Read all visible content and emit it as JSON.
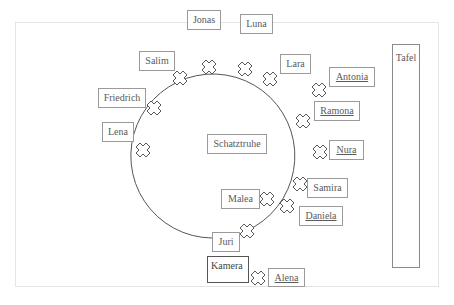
{
  "diagram": {
    "type": "seating-plan",
    "center_object": "Schatztruhe",
    "board_label": "Tafel",
    "camera_label": "Kamera",
    "circle_names": [
      "Jonas",
      "Luna",
      "Lara",
      "Salim",
      "Friedrich",
      "Lena",
      "Ramona",
      "Samira",
      "Daniela",
      "Juri"
    ],
    "outside_names": [
      "Antonia",
      "Nura",
      "Malea",
      "Alena"
    ],
    "underlined_names": [
      "Antonia",
      "Ramona",
      "Nura",
      "Daniela",
      "Alena"
    ],
    "labels": {
      "jonas": "Jonas",
      "luna": "Luna",
      "lara": "Lara",
      "salim": "Salim",
      "friedrich": "Friedrich",
      "lena": "Lena",
      "antonia": "Antonia",
      "ramona": "Ramona",
      "nura": "Nura",
      "schatztruhe": "Schatztruhe",
      "samira": "Samira",
      "malea": "Malea",
      "daniela": "Daniela",
      "juri": "Juri",
      "kamera": "Kamera",
      "alena": "Alena",
      "tafel": "Tafel"
    },
    "seat_marker_icon": "x-cross-icon",
    "colors": {
      "line": "#555555",
      "box_border": "#9a9a9a",
      "frame": "#e4e4e4"
    }
  }
}
